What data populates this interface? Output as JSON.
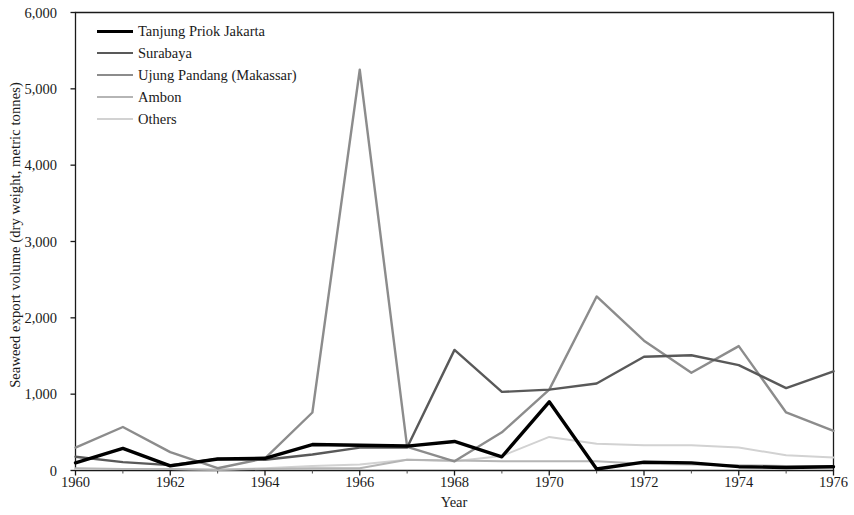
{
  "chart_data": {
    "type": "line",
    "title": "",
    "xlabel": "Year",
    "ylabel": "Seaweed export volume (dry weight, metric tonnes)",
    "xlim": [
      1960,
      1976
    ],
    "ylim": [
      0,
      6000
    ],
    "xticks": [
      "1960",
      "1962",
      "1964",
      "1966",
      "1968",
      "1970",
      "1972",
      "1974",
      "1976"
    ],
    "xtick_values": [
      1960,
      1962,
      1964,
      1966,
      1968,
      1970,
      1972,
      1974,
      1976
    ],
    "yticks": [
      "0",
      "1,000",
      "2,000",
      "3,000",
      "4,000",
      "5,000",
      "6,000"
    ],
    "ytick_values": [
      0,
      1000,
      2000,
      3000,
      4000,
      5000,
      6000
    ],
    "minor_xticks": [
      1961,
      1963,
      1965,
      1967,
      1969,
      1971,
      1973,
      1975
    ],
    "grid": false,
    "legend_position": "top-left",
    "x": [
      1960,
      1961,
      1962,
      1963,
      1964,
      1965,
      1966,
      1967,
      1968,
      1969,
      1970,
      1971,
      1972,
      1973,
      1974,
      1975,
      1976
    ],
    "series": [
      {
        "name": "Tanjung Priok Jakarta",
        "color": "#000000",
        "width": 3.4,
        "values": [
          100,
          290,
          60,
          150,
          160,
          340,
          330,
          320,
          380,
          180,
          900,
          20,
          110,
          100,
          50,
          40,
          50
        ]
      },
      {
        "name": "Surabaya",
        "color": "#595959",
        "width": 2.4,
        "values": [
          180,
          110,
          70,
          150,
          140,
          210,
          300,
          300,
          1580,
          1030,
          1060,
          1140,
          1490,
          1510,
          1380,
          1080,
          1300
        ]
      },
      {
        "name": "Ujung Pandang (Makassar)",
        "color": "#8c8c8c",
        "width": 2.4,
        "values": [
          300,
          570,
          240,
          30,
          160,
          760,
          5250,
          310,
          120,
          500,
          1060,
          2280,
          1700,
          1280,
          1630,
          760,
          520
        ]
      },
      {
        "name": "Ambon",
        "color": "#b5b5b5",
        "width": 2.0,
        "values": [
          30,
          20,
          20,
          10,
          20,
          30,
          30,
          140,
          130,
          120,
          120,
          120,
          90,
          80,
          70,
          60,
          60
        ]
      },
      {
        "name": "Others",
        "color": "#d2d2d2",
        "width": 2.0,
        "values": [
          20,
          20,
          20,
          10,
          30,
          60,
          80,
          140,
          120,
          190,
          440,
          350,
          330,
          330,
          300,
          200,
          170
        ]
      }
    ]
  }
}
